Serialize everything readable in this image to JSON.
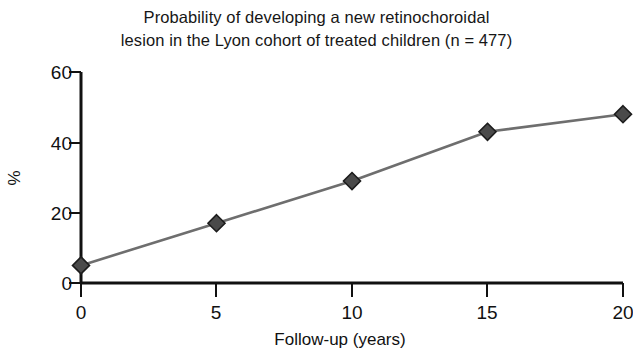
{
  "chart_data": {
    "type": "line",
    "title": "Probability of developing a new retinochoroidal lesion in the Lyon cohort of treated children (n = 477)",
    "title_lines": [
      "Probability of developing a new retinochoroidal",
      "lesion in the Lyon cohort of treated children (n = 477)"
    ],
    "xlabel": "Follow-up (years)",
    "ylabel": "%",
    "x": [
      0,
      5,
      10,
      15,
      20
    ],
    "values": [
      5,
      17,
      29,
      43,
      48
    ],
    "series": [
      {
        "name": "Probability of new retinochoroidal lesion",
        "values": [
          5,
          17,
          29,
          43,
          48
        ]
      }
    ],
    "xlim": [
      0,
      20
    ],
    "ylim": [
      0,
      60
    ],
    "xticks": [
      0,
      5,
      10,
      15,
      20
    ],
    "yticks": [
      0,
      20,
      40,
      60
    ],
    "xtick_labels": [
      "0",
      "5",
      "10",
      "15",
      "20"
    ],
    "ytick_labels": [
      "0",
      "20",
      "40",
      "60"
    ],
    "grid": false,
    "legend": false,
    "marker": "diamond",
    "line_color": "#6e6e6e",
    "marker_color": "#4a4a4a",
    "marker_edge_color": "#1c1c1c",
    "axis_color": "#111111",
    "background_color": "#ffffff"
  }
}
